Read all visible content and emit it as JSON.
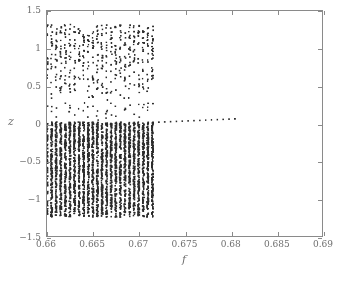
{
  "figure": {
    "background_color": "#ffffff",
    "frame_color": "#8a8a8a",
    "text_color": "#6f6f6f",
    "marker_color": "#2b2b2b"
  },
  "axis_titles": {
    "x": "f",
    "y": "z"
  },
  "chart_data": {
    "type": "scatter",
    "title": "",
    "subtitle": "",
    "xlabel": "f",
    "ylabel": "z",
    "xlim": [
      0.66,
      0.69
    ],
    "ylim": [
      -1.5,
      1.5
    ],
    "grid": false,
    "legend": null,
    "xticks": [
      0.66,
      0.665,
      0.67,
      0.675,
      0.68,
      0.685,
      0.69
    ],
    "xtick_labels": [
      "0.66",
      "0.665",
      "0.67",
      "0.675",
      "0.68",
      "0.685",
      "0.69"
    ],
    "yticks": [
      -1.5,
      -1,
      -0.5,
      0,
      0.5,
      1,
      1.5
    ],
    "ytick_labels": [
      "-1.5",
      "-1",
      "-0.5",
      "0",
      "0.5",
      "1",
      "1.5"
    ],
    "marker": "square",
    "marker_size_px": 1.6,
    "regions": [
      {
        "name": "chaotic-band",
        "x_range": [
          0.66,
          0.6715
        ],
        "column_count": 24,
        "dense_y_range": [
          -1.25,
          0.02
        ],
        "sparse_y_range": [
          0.02,
          1.32
        ],
        "points_per_column_dense": 150,
        "points_per_column_sparse": 26
      },
      {
        "name": "periodic-branch",
        "x_range": [
          0.6722,
          0.6805
        ],
        "y_start": 0.018,
        "y_end": 0.062,
        "point_count": 14
      }
    ]
  },
  "caption_remnant": ""
}
